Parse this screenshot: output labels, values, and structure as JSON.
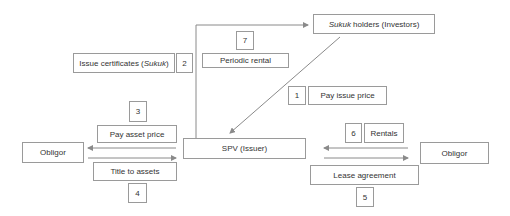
{
  "diagram": {
    "title": "",
    "colors": {
      "line": "#8a8a8a",
      "border": "#9a9a9a",
      "text": "#333333"
    },
    "nodes": {
      "investors": {
        "label_italic": "Sukuk",
        "label_rest": " holders (Investors)"
      },
      "spv": {
        "label": "SPV (Issuer)"
      },
      "obligor_left": {
        "label": "Obligor"
      },
      "obligor_right": {
        "label": "Obligor"
      }
    },
    "steps": [
      {
        "num": "1",
        "label": "Pay issue price"
      },
      {
        "num": "2",
        "label_prefix": "Issue certificates (",
        "label_italic": "Sukuk",
        "label_suffix": ")"
      },
      {
        "num": "3",
        "label": "Pay asset price"
      },
      {
        "num": "4",
        "label": "Title to assets"
      },
      {
        "num": "5",
        "label": "Lease agreement"
      },
      {
        "num": "6",
        "label": "Rentals"
      },
      {
        "num": "7",
        "label": "Periodic rental"
      }
    ]
  }
}
